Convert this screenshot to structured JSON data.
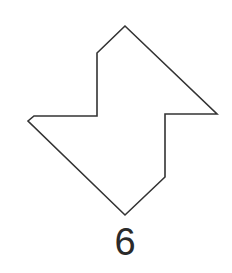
{
  "figure": {
    "label": "6",
    "shape": "polygon",
    "stroke_color": "#333333",
    "fill_color": "#ffffff",
    "vertices": [
      [
        125,
        26
      ],
      [
        97,
        53
      ],
      [
        97,
        116
      ],
      [
        34,
        116
      ],
      [
        28,
        121
      ],
      [
        125,
        215
      ],
      [
        165,
        177
      ],
      [
        165,
        114
      ],
      [
        217,
        114
      ]
    ]
  }
}
